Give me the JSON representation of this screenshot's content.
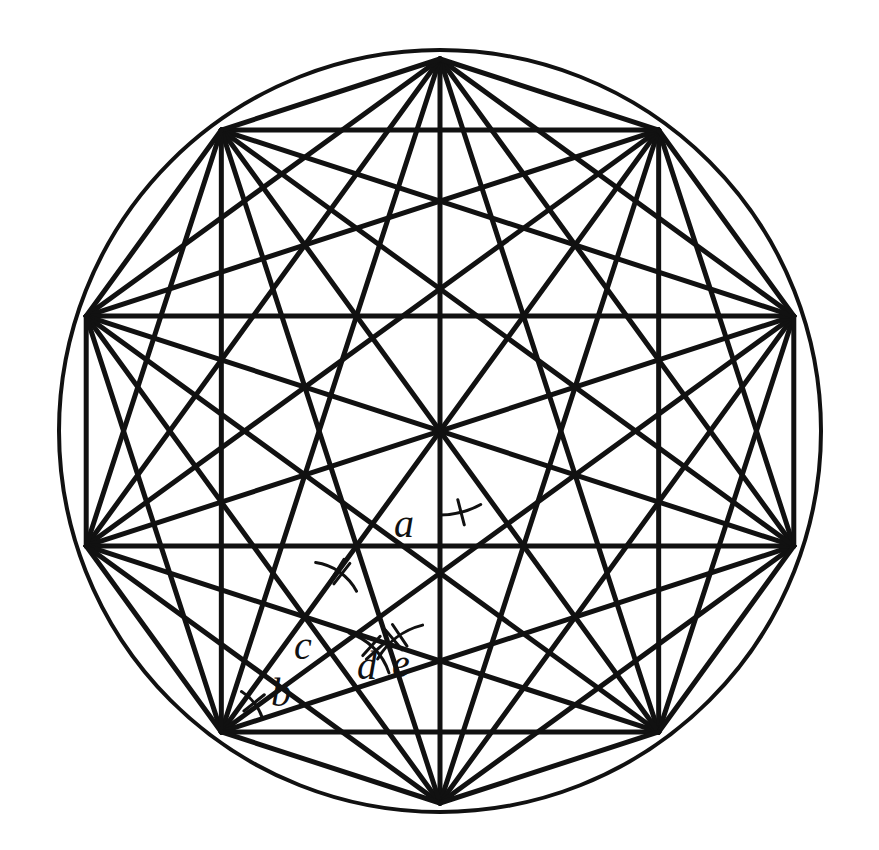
{
  "figure": {
    "shape_name": "decagon",
    "stroke_color": "#111111",
    "background_color": "#ffffff",
    "geometry": {
      "center_x": 440,
      "center_y": 431,
      "circle_radius": 381,
      "polygon_radius": 372,
      "vertex_count": 10,
      "start_angle_deg": -90,
      "circle_stroke_width": 4,
      "chord_stroke_width": 5,
      "edge_stroke_width": 5
    },
    "angle_labels": [
      {
        "id": "a",
        "text": "a",
        "label_x": 404,
        "label_y": 528,
        "font_size": 40,
        "tick_count": 1,
        "arc": {
          "cx": 440,
          "cy": 431,
          "r": 84,
          "start_deg": 61,
          "end_deg": 90
        },
        "description": "central angle between vertical radius and chord to lower-left vertex"
      },
      {
        "id": "b",
        "text": "b",
        "label_x": 281,
        "label_y": 697,
        "font_size": 40,
        "tick_count": 1,
        "arc": {
          "cx": 215,
          "cy": 734,
          "r": 50,
          "start_deg": -58,
          "end_deg": -19
        },
        "description": "base angle of triangle at lower-left vertex"
      },
      {
        "id": "c",
        "text": "c",
        "label_x": 303,
        "label_y": 650,
        "font_size": 40,
        "tick_count": 2,
        "arc": {
          "cx": 308,
          "cy": 617,
          "r": 55,
          "start_deg": -82,
          "end_deg": -28
        },
        "description": "angle at upper vertex of the small triangle"
      },
      {
        "id": "d",
        "text": "d",
        "label_x": 367,
        "label_y": 670,
        "font_size": 40,
        "tick_count": 2,
        "arc": {
          "cx": 330,
          "cy": 692,
          "r": 62,
          "start_deg": -72,
          "end_deg": -18
        },
        "description": "angle adjacent to c along the chord"
      },
      {
        "id": "e",
        "text": "e",
        "label_x": 401,
        "label_y": 668,
        "font_size": 40,
        "tick_count": 2,
        "arc": {
          "cx": 440,
          "cy": 695,
          "r": 72,
          "start_deg": -150,
          "end_deg": -104
        },
        "description": "angle at lower vertex between chord and polygon edge"
      }
    ]
  }
}
